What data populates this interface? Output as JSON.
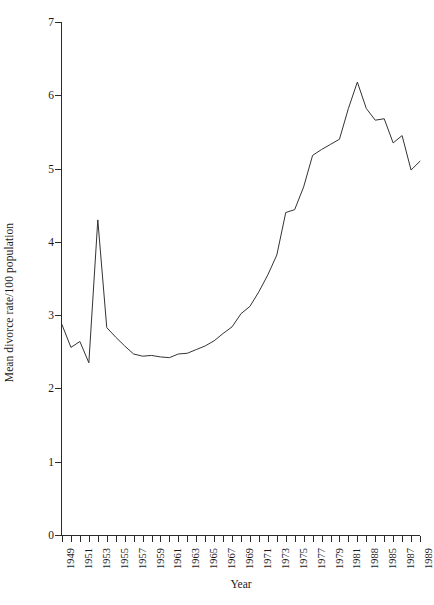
{
  "chart_data": {
    "type": "line",
    "title": "",
    "xlabel": "Year",
    "ylabel": "Mean divorce rate/100 population",
    "xlim": [
      1949,
      1989
    ],
    "ylim": [
      0,
      7
    ],
    "grid": false,
    "legend": "none",
    "y_ticks": [
      0,
      1,
      2,
      3,
      4,
      5,
      6,
      7
    ],
    "y_tick_labels": [
      "0",
      "1",
      "2",
      "3",
      "4",
      "5",
      "6",
      "7"
    ],
    "x_tick_values": [
      1949,
      1950,
      1951,
      1952,
      1953,
      1954,
      1955,
      1956,
      1957,
      1958,
      1959,
      1960,
      1961,
      1962,
      1963,
      1964,
      1965,
      1966,
      1967,
      1968,
      1969,
      1970,
      1971,
      1972,
      1973,
      1974,
      1975,
      1976,
      1977,
      1978,
      1979,
      1980,
      1981,
      1982,
      1983,
      1984,
      1985,
      1986,
      1987,
      1988,
      1989
    ],
    "x_tick_labels": [
      {
        "value": 1949,
        "label": "1949"
      },
      {
        "value": 1951,
        "label": "1951"
      },
      {
        "value": 1953,
        "label": "1953"
      },
      {
        "value": 1955,
        "label": "1955"
      },
      {
        "value": 1957,
        "label": "1957"
      },
      {
        "value": 1959,
        "label": "1959"
      },
      {
        "value": 1961,
        "label": "1961"
      },
      {
        "value": 1963,
        "label": "1963"
      },
      {
        "value": 1965,
        "label": "1965"
      },
      {
        "value": 1967,
        "label": "1967"
      },
      {
        "value": 1969,
        "label": "1969"
      },
      {
        "value": 1971,
        "label": "1971"
      },
      {
        "value": 1973,
        "label": "1973"
      },
      {
        "value": 1975,
        "label": "1975"
      },
      {
        "value": 1977,
        "label": "1977"
      },
      {
        "value": 1979,
        "label": "1979"
      },
      {
        "value": 1981,
        "label": "1981"
      },
      {
        "value": 1983,
        "label": "1988"
      },
      {
        "value": 1985,
        "label": "1985"
      },
      {
        "value": 1987,
        "label": "1987"
      },
      {
        "value": 1989,
        "label": "1989"
      }
    ],
    "x": [
      1949,
      1950,
      1951,
      1952,
      1953,
      1954,
      1955,
      1956,
      1957,
      1958,
      1959,
      1960,
      1961,
      1962,
      1963,
      1964,
      1965,
      1966,
      1967,
      1968,
      1969,
      1970,
      1971,
      1972,
      1973,
      1974,
      1975,
      1976,
      1977,
      1978,
      1979,
      1980,
      1981,
      1982,
      1983,
      1984,
      1985,
      1986,
      1987,
      1988,
      1989
    ],
    "values": [
      2.87,
      2.56,
      2.64,
      2.35,
      4.3,
      2.83,
      2.7,
      2.58,
      2.47,
      2.44,
      2.45,
      2.43,
      2.42,
      2.47,
      2.48,
      2.53,
      2.58,
      2.65,
      2.75,
      2.84,
      3.02,
      3.12,
      3.32,
      3.55,
      3.82,
      4.4,
      4.44,
      4.75,
      5.18,
      5.26,
      5.33,
      5.4,
      5.82,
      6.18,
      5.82,
      5.66,
      5.68,
      5.35,
      5.45,
      4.98,
      5.1
    ],
    "line_color": "#333333",
    "axis_color": "#2b2b2b",
    "background": "#ffffff"
  }
}
